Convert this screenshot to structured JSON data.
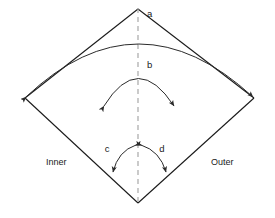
{
  "figure": {
    "type": "schematic-diagram",
    "background_color": "#ffffff",
    "line_color": "#1a1a1a",
    "axis_color": "#a8a8a8",
    "arrow_color": "#2b2b2b"
  },
  "labels": {
    "a": "a",
    "b": "b",
    "c": "c",
    "d": "d",
    "inner": "Inner",
    "outer": "Outer"
  },
  "geometry": {
    "apex_top": {
      "x": 138,
      "y": 8
    },
    "vertex_left": {
      "x": 25,
      "y": 98
    },
    "vertex_right": {
      "x": 254,
      "y": 98
    },
    "vertex_bottom": {
      "x": 138,
      "y": 203
    },
    "centerline": {
      "x": 138,
      "y_top": 8,
      "y_bottom": 205
    }
  },
  "annotations": [
    {
      "id": "a",
      "label": "a",
      "kind": "double-headed-arc",
      "from": {
        "x": 25,
        "y": 98
      },
      "to": {
        "x": 254,
        "y": 98
      },
      "apex": {
        "x": 138,
        "y": 27
      },
      "label_pos": {
        "x": 147,
        "y": 14
      }
    },
    {
      "id": "b",
      "label": "b",
      "kind": "double-headed-arc",
      "from": {
        "x": 104,
        "y": 106
      },
      "to": {
        "x": 174,
        "y": 106
      },
      "apex": {
        "x": 138,
        "y": 75
      },
      "label_pos": {
        "x": 147,
        "y": 65
      }
    },
    {
      "id": "c",
      "label": "c",
      "kind": "double-headed-arc",
      "from": {
        "x": 136,
        "y": 144
      },
      "to": {
        "x": 113,
        "y": 173
      },
      "label_pos": {
        "x": 107,
        "y": 149
      }
    },
    {
      "id": "d",
      "label": "d",
      "kind": "double-headed-arc",
      "from": {
        "x": 141,
        "y": 144
      },
      "to": {
        "x": 165,
        "y": 173
      },
      "label_pos": {
        "x": 161,
        "y": 149
      }
    },
    {
      "id": "inner",
      "label": "Inner",
      "kind": "region-label",
      "label_pos": {
        "x": 46,
        "y": 163
      }
    },
    {
      "id": "outer",
      "label": "Outer",
      "kind": "region-label",
      "label_pos": {
        "x": 211,
        "y": 163
      }
    }
  ]
}
